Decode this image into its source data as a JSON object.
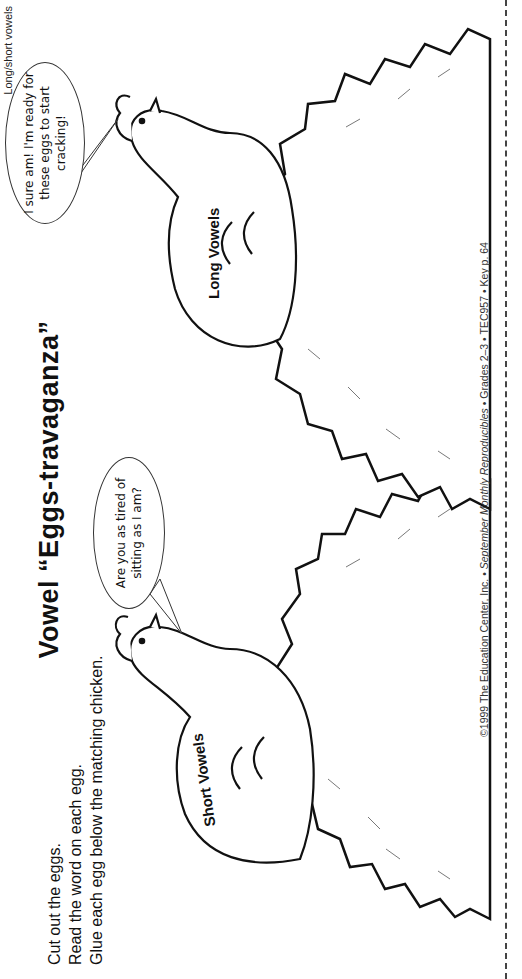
{
  "subject_tag": "Long/short vowels",
  "title": "Vowel “Eggs-travaganza”",
  "instructions": [
    "Cut out the eggs.",
    "Read the word on each egg.",
    "Glue each egg below the matching chicken."
  ],
  "chickens": [
    {
      "label": "Short Vowels",
      "speech": "Are you as tired of sitting as I am?"
    },
    {
      "label": "Long Vowels",
      "speech": "I sure am! I'm ready for these eggs to start cracking!"
    }
  ],
  "footer": {
    "prefix": "©1999 The Education Center, Inc. • ",
    "italic": "September Monthly Reproducibles",
    "suffix": " • Grades 2–3 • TEC957 • Key p. 64"
  },
  "colors": {
    "ink": "#111111",
    "paper": "#ffffff"
  }
}
